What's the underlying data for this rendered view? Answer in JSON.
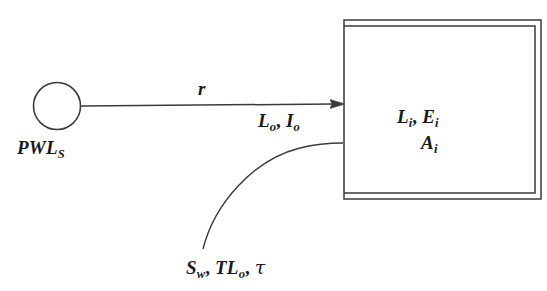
{
  "diagram": {
    "nodes": {
      "source": {
        "shape": "circle",
        "label_base": "PWL",
        "label_sub": "S",
        "name": "sound-power-level-source"
      },
      "room": {
        "shape": "double-rectangle",
        "name": "indoor-receiving-room",
        "lines": [
          {
            "base_1": "L",
            "sub_1": "i",
            "sep": ", ",
            "base_2": "E",
            "sub_2": "i"
          },
          {
            "base_1": "A",
            "sub_1": "i"
          }
        ]
      }
    },
    "edges": {
      "direct_path": {
        "name": "propagation-arrow",
        "label_base": "r",
        "label_sub": "",
        "style": "straight-arrow"
      },
      "facade_path": {
        "name": "facade-transmission-curve",
        "style": "curve"
      }
    },
    "labels": {
      "source_label": "PWLS",
      "rate_label": "r",
      "outdoor_label": "Lo, Io",
      "indoor_label_line1": "Li, Ei",
      "indoor_label_line2": "Ai",
      "partition_label": "Sw, TLo, τ",
      "outdoor_parts": {
        "base_1": "L",
        "sub_1": "o",
        "sep": ", ",
        "base_2": "I",
        "sub_2": "o"
      },
      "partition_parts": {
        "base_1": "S",
        "sub_1": "w",
        "base_2": "TL",
        "sub_2": "o",
        "base_3": "τ"
      }
    },
    "colors": {
      "stroke": "#3a3a3a",
      "text": "#1b1b1b",
      "background": "#ffffff"
    }
  }
}
